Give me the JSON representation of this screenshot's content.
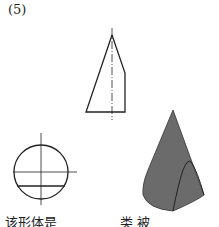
{
  "problem_number": "(5)",
  "caption_left": "该形体是",
  "caption_right": "类  被",
  "colors": {
    "line": "#222222",
    "solid_fill": "#6b6b6b",
    "solid_edge": "#333333"
  }
}
